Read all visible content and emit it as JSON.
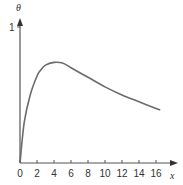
{
  "chart_data": {
    "type": "line",
    "title": "",
    "xlabel": "x",
    "ylabel": "θ",
    "xlim": [
      0,
      17
    ],
    "ylim": [
      0,
      1
    ],
    "x_ticks": [
      0,
      2,
      4,
      6,
      8,
      10,
      12,
      14,
      16
    ],
    "y_ticks": [
      1
    ],
    "grid": false,
    "legend": null,
    "series": [
      {
        "name": "θ(x)",
        "x": [
          0,
          0.5,
          1.2,
          2,
          2.4,
          3,
          4,
          5,
          6,
          8,
          10,
          12,
          14,
          16,
          16.5
        ],
        "y": [
          0,
          0.3,
          0.5,
          0.64,
          0.68,
          0.72,
          0.74,
          0.735,
          0.7,
          0.63,
          0.56,
          0.5,
          0.45,
          0.4,
          0.39
        ]
      }
    ],
    "colors": {
      "curve": "#6b6b6b",
      "axis": "#555555"
    }
  },
  "labels": {
    "x_axis": "x",
    "y_axis": "θ",
    "y_tick_1": "1",
    "x_ticks": [
      "0",
      "2",
      "4",
      "6",
      "8",
      "10",
      "12",
      "14",
      "16"
    ]
  }
}
